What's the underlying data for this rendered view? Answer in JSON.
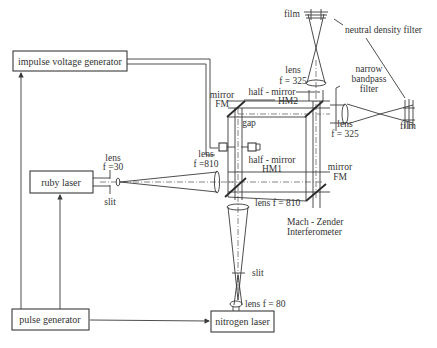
{
  "diagram": {
    "boxes": {
      "impulse_voltage_generator": "impulse voltage generator",
      "ruby_laser": "ruby laser",
      "pulse_generator": "pulse generator",
      "nitrogen_laser": "nitrogen laser"
    },
    "labels": {
      "film_top": "film",
      "neutral_density_filter": "neutral density filter",
      "lens_top_1": "lens",
      "lens_top_2": "f = 325",
      "narrow_bandpass_1": "narrow",
      "narrow_bandpass_2": "bandpass",
      "narrow_bandpass_3": "filter",
      "half_mirror_hm2_1": "half - mirror",
      "half_mirror_hm2_2": "HM2",
      "mirror_fm_top_1": "mirror",
      "mirror_fm_top_2": "FM",
      "lens_right_1": "lens",
      "lens_right_2": "f = 325",
      "film_right": "film",
      "gap": "gap",
      "lens_f810_left_1": "lens",
      "lens_f810_left_2": "f =810",
      "half_mirror_hm1_1": "half - mirror",
      "half_mirror_hm1_2": "HM1",
      "mirror_fm_bottom_1": "mirror",
      "mirror_fm_bottom_2": "FM",
      "lens_f30_1": "lens",
      "lens_f30_2": "f =30",
      "slit_ruby": "slit",
      "lens_f810_bottom": "lens f = 810",
      "interferometer_1": "Mach - Zender",
      "interferometer_2": "Interferometer",
      "slit_nitrogen": "slit",
      "lens_f80": "lens f = 80"
    }
  }
}
